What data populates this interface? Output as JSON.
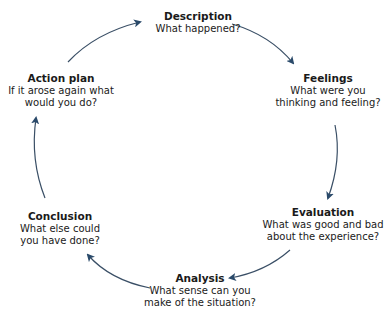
{
  "diagram": {
    "type": "cycle",
    "arrow_color": "#2f4f6f",
    "nodes": [
      {
        "id": "description",
        "title": "Description",
        "question": "What happened?"
      },
      {
        "id": "feelings",
        "title": "Feelings",
        "question": "What were you\nthinking and feeling?"
      },
      {
        "id": "evaluation",
        "title": "Evaluation",
        "question": "What was good and bad\nabout the experience?"
      },
      {
        "id": "analysis",
        "title": "Analysis",
        "question": "What sense can you\nmake of the situation?"
      },
      {
        "id": "conclusion",
        "title": "Conclusion",
        "question": "What else could\nyou have done?"
      },
      {
        "id": "action",
        "title": "Action plan",
        "question": "If it arose again what\nwould you do?"
      }
    ]
  }
}
